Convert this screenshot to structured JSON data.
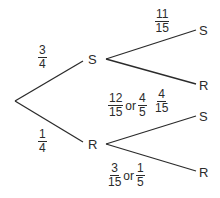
{
  "diagram": {
    "type": "probability-tree",
    "line_color": "#2b2b2b",
    "level1": {
      "top": {
        "node_label": "S",
        "probability": {
          "numerator": "3",
          "denominator": "4"
        },
        "children": [
          {
            "node_label": "S",
            "probability": {
              "numerator": "11",
              "denominator": "15"
            }
          },
          {
            "node_label": "R",
            "probability": {
              "numerator": "4",
              "denominator": "15"
            }
          }
        ]
      },
      "bottom": {
        "node_label": "R",
        "probability": {
          "numerator": "1",
          "denominator": "4"
        },
        "children": [
          {
            "node_label": "S",
            "probability": {
              "numerator": "12",
              "denominator": "15"
            },
            "or_word": "or",
            "simplified": {
              "numerator": "4",
              "denominator": "5"
            }
          },
          {
            "node_label": "R",
            "probability": {
              "numerator": "3",
              "denominator": "15"
            },
            "or_word": "or",
            "simplified": {
              "numerator": "1",
              "denominator": "5"
            }
          }
        ]
      }
    }
  }
}
